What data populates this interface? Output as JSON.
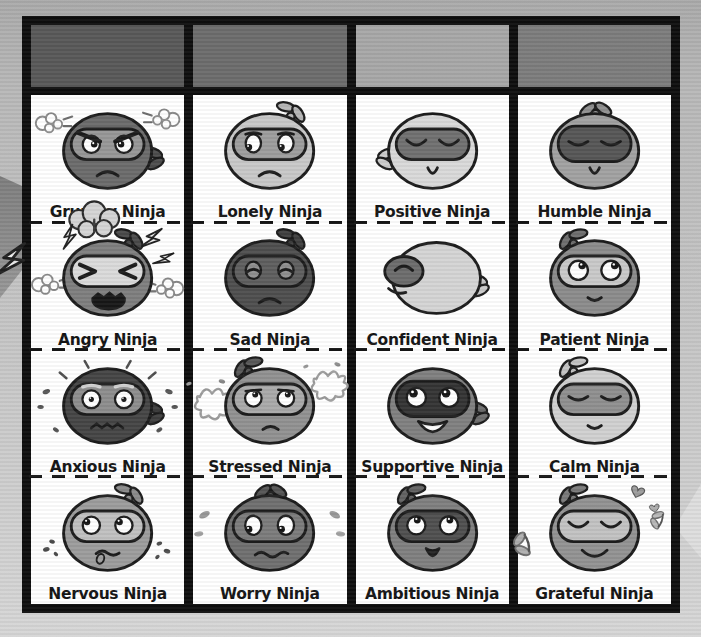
{
  "page": {
    "background_top": "#aaaaaa",
    "background_bottom": "#d6d6d6",
    "frame_color": "#0e0e0e",
    "cell_background": "#ffffff",
    "label_color": "#141414"
  },
  "poster": {
    "title": "Ninja emotions chart",
    "columns": [
      {
        "name": "column-1",
        "header_color": "#585858",
        "cells": [
          {
            "label": "Grumpy Ninja",
            "icon": "grumpy-ninja-icon",
            "face": {
              "head": "#6b6b6b",
              "mask": "#979797",
              "knot": "#4d4d4d",
              "knotPos": "right",
              "eyes": "angry",
              "mouth": "frown",
              "extras": [
                "steam-left",
                "steam-right"
              ]
            }
          },
          {
            "label": "Angry Ninja",
            "icon": "angry-ninja-icon",
            "face": {
              "head": "#7e7e7e",
              "mask": "#dadada",
              "knot": "#4a4a4a",
              "knotPos": "top-right",
              "eyes": "scrunched",
              "mouth": "shout",
              "extras": [
                "explosion",
                "bolt-far-left",
                "bolt-left",
                "bolt-right",
                "bolt-right-2",
                "steam-left-low",
                "steam-right-low"
              ]
            }
          },
          {
            "label": "Anxious Ninja",
            "icon": "anxious-ninja-icon",
            "face": {
              "head": "#454545",
              "mask": "#8d8d8d",
              "knot": "#3e3e3e",
              "knotPos": "right",
              "eyes": "wide",
              "mouth": "zigzag",
              "extras": [
                "radiate"
              ]
            }
          },
          {
            "label": "Nervous Ninja",
            "icon": "nervous-ninja-icon",
            "face": {
              "head": "#9c9c9c",
              "mask": "#c0c0c0",
              "knot": "#8a8a8a",
              "knotPos": "top-right",
              "eyes": "side-up",
              "mouth": "tongue",
              "extras": [
                "chips-left",
                "chips-right"
              ]
            }
          }
        ]
      },
      {
        "name": "column-2",
        "header_color": "#6c6c6c",
        "cells": [
          {
            "label": "Lonely Ninja",
            "icon": "lonely-ninja-icon",
            "face": {
              "head": "#c8c8c8",
              "mask": "#9d9d9d",
              "knot": "#b6b6b6",
              "knotPos": "top-right",
              "eyes": "sad-left",
              "mouth": "frown",
              "extras": []
            }
          },
          {
            "label": "Sad Ninja",
            "icon": "sad-ninja-icon",
            "face": {
              "head": "#4e4e4e",
              "mask": "#5e5e5e",
              "knot": "#404040",
              "knotPos": "top-right",
              "eyes": "sad-closed",
              "mouth": "frown",
              "extras": []
            }
          },
          {
            "label": "Stressed Ninja",
            "icon": "stressed-ninja-icon",
            "face": {
              "head": "#919191",
              "mask": "#a9a9a9",
              "knot": "#585858",
              "knotPos": "top-left",
              "eyes": "worried-up",
              "mouth": "frown-small",
              "extras": [
                "scribble-left",
                "scribble-right"
              ]
            }
          },
          {
            "label": "Worry Ninja",
            "icon": "worry-ninja-icon",
            "face": {
              "head": "#6f6f6f",
              "mask": "#7b7b7b",
              "knot": "#555555",
              "knotPos": "top",
              "eyes": "down-left",
              "mouth": "wavy",
              "extras": [
                "drops-left",
                "drops-right"
              ]
            }
          }
        ]
      },
      {
        "name": "column-3",
        "header_color": "#a7a7a7",
        "cells": [
          {
            "label": "Positive Ninja",
            "icon": "positive-ninja-icon",
            "face": {
              "head": "#d9d9d9",
              "mask": "#707070",
              "knot": "#cccccc",
              "knotPos": "left",
              "eyes": "closed-happy",
              "mouth": "u-small",
              "extras": []
            }
          },
          {
            "label": "Confident Ninja",
            "icon": "confident-ninja-icon",
            "face": {
              "head": "#d4d4d4",
              "mask": "#6c6c6c",
              "knot": "#c9c9c9",
              "knotPos": "right",
              "eyes": "profile",
              "mouth": "smirk",
              "extras": []
            }
          },
          {
            "label": "Supportive Ninja",
            "icon": "supportive-ninja-icon",
            "face": {
              "head": "#808080",
              "mask": "#343434",
              "maskTall": true,
              "knot": "#6e6e6e",
              "knotPos": "right",
              "eyes": "happy-up",
              "mouth": "open-smile",
              "extras": []
            }
          },
          {
            "label": "Ambitious Ninja",
            "icon": "ambitious-ninja-icon",
            "face": {
              "head": "#7f7f7f",
              "mask": "#4f4f4f",
              "knot": "#636363",
              "knotPos": "top-left",
              "eyes": "look-up",
              "mouth": "u-open",
              "extras": []
            }
          }
        ]
      },
      {
        "name": "column-4",
        "header_color": "#7c7c7c",
        "cells": [
          {
            "label": "Humble Ninja",
            "icon": "humble-ninja-icon",
            "face": {
              "head": "#a1a1a1",
              "mask": "#565656",
              "maskTall": true,
              "knot": "#8f8f8f",
              "knotPos": "top",
              "eyes": "closed-calm",
              "mouth": "u-small",
              "extras": []
            }
          },
          {
            "label": "Patient Ninja",
            "icon": "patient-ninja-icon",
            "face": {
              "head": "#8b8b8b",
              "mask": "#c9c9c9",
              "knot": "#6f6f6f",
              "knotPos": "top-left",
              "eyes": "look-up-right",
              "mouth": "gentle",
              "extras": []
            }
          },
          {
            "label": "Calm Ninja",
            "icon": "calm-ninja-icon",
            "face": {
              "head": "#d0d0d0",
              "mask": "#8f8f8f",
              "knot": "#c3c3c3",
              "knotPos": "top-left",
              "eyes": "closed-calm",
              "mouth": "gentle",
              "extras": []
            }
          },
          {
            "label": "Grateful Ninja",
            "icon": "grateful-ninja-icon",
            "face": {
              "head": "#929292",
              "mask": "#c2c2c2",
              "knot": "#7a7a7a",
              "knotPos": "top-left",
              "eyes": "closed-happy",
              "mouth": "wide-smile",
              "extras": [
                "hearts",
                "butterfly-left",
                "butterfly-right"
              ]
            }
          }
        ]
      }
    ]
  }
}
